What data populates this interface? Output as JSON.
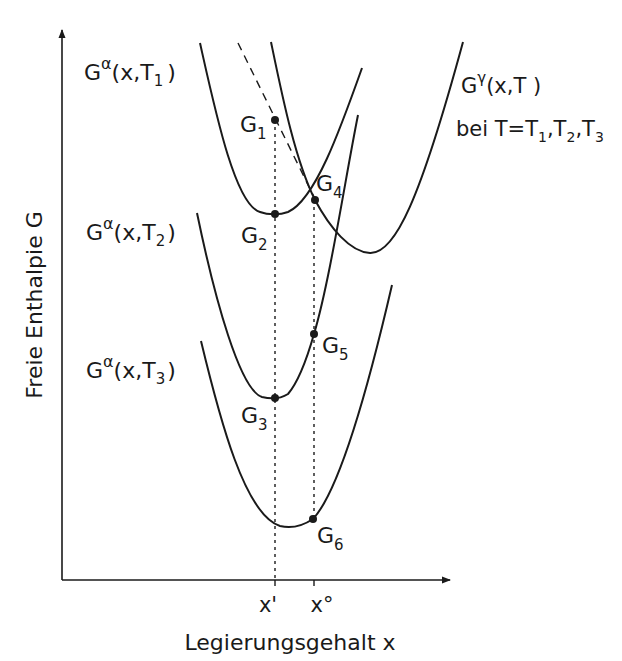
{
  "figure": {
    "y_axis_label": "Freie Enthalpie G",
    "x_axis_label": "Legierungsgehalt x",
    "x_ticks": [
      {
        "label": "x'",
        "x": 275
      },
      {
        "label": "x°",
        "x": 314
      }
    ]
  },
  "curves": {
    "alpha_T1": {
      "label_main": "G",
      "label_sup": "α",
      "label_args": "(x,T",
      "label_sub": "1",
      "label_close": ")"
    },
    "alpha_T2": {
      "label_main": "G",
      "label_sup": "α",
      "label_args": "(x,T",
      "label_sub": "2",
      "label_close": ")"
    },
    "alpha_T3": {
      "label_main": "G",
      "label_sup": "α",
      "label_args": "(x,T",
      "label_sub": "3",
      "label_close": ")"
    },
    "gamma": {
      "label_main": "G",
      "label_sup": "γ",
      "label_args": "(x,T )",
      "line2": "bei  T=T",
      "sub1": "1",
      "sep1": ",T",
      "sub2": "2",
      "sep2": ",T",
      "sub3": "3"
    }
  },
  "points": [
    {
      "name": "G",
      "sub": "1",
      "x": 275,
      "y": 120
    },
    {
      "name": "G",
      "sub": "2",
      "x": 275,
      "y": 214
    },
    {
      "name": "G",
      "sub": "3",
      "x": 275,
      "y": 398
    },
    {
      "name": "G",
      "sub": "4",
      "x": 315,
      "y": 200
    },
    {
      "name": "G",
      "sub": "5",
      "x": 314,
      "y": 334
    },
    {
      "name": "G",
      "sub": "6",
      "x": 313,
      "y": 519
    }
  ],
  "colors": {
    "ink": "#1a1a1a",
    "background": "#ffffff"
  }
}
